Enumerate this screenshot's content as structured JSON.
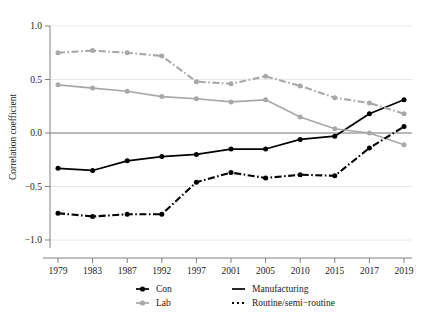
{
  "chart_data": {
    "type": "line",
    "title": "",
    "xlabel": "",
    "ylabel": "Correlation coefficient",
    "categories": [
      "1979",
      "1983",
      "1987",
      "1992",
      "1997",
      "2001",
      "2005",
      "2010",
      "2015",
      "2017",
      "2019"
    ],
    "ylim": [
      -1.15,
      1.12
    ],
    "yticks": [
      "1.0",
      "0.5",
      "0.0",
      "-0.5",
      "-1.0"
    ],
    "ytick_values": [
      1.0,
      0.5,
      0.0,
      -0.5,
      -1.0
    ],
    "grid": true,
    "grid_axis": "y",
    "zero_line": true,
    "legend_position": "bottom",
    "series": [
      {
        "name": "Con",
        "color": "#000000",
        "style": "solid",
        "marker": "circle",
        "values": [
          -0.33,
          -0.35,
          -0.26,
          -0.22,
          -0.2,
          -0.15,
          -0.15,
          -0.06,
          -0.03,
          0.18,
          0.31
        ]
      },
      {
        "name": "Lab",
        "color": "#a8a8a8",
        "style": "solid",
        "marker": "circle",
        "values": [
          0.45,
          0.42,
          0.39,
          0.34,
          0.32,
          0.29,
          0.31,
          0.15,
          0.04,
          0.0,
          -0.11
        ]
      },
      {
        "name": "Manufacturing",
        "color": "#a8a8a8",
        "style": "dash-dot",
        "marker": "circle",
        "values": [
          0.75,
          0.77,
          0.75,
          0.72,
          0.48,
          0.46,
          0.53,
          0.44,
          0.33,
          0.28,
          0.18
        ]
      },
      {
        "name": "Routine/semi-routine",
        "color": "#000000",
        "style": "dash-dot",
        "marker": "circle",
        "values": [
          -0.75,
          -0.78,
          -0.76,
          -0.76,
          -0.46,
          -0.37,
          -0.42,
          -0.39,
          -0.4,
          -0.14,
          0.06
        ]
      }
    ]
  },
  "legend": {
    "entries": [
      {
        "label": "Con",
        "color": "#000000",
        "style": "solid",
        "marker": true
      },
      {
        "label": "Lab",
        "color": "#a8a8a8",
        "style": "solid",
        "marker": true
      },
      {
        "label": "Manufacturing",
        "color": "#000000",
        "style": "solid",
        "marker": false
      },
      {
        "label": "Routine/semi-routine",
        "color": "#000000",
        "style": "dotted",
        "marker": false
      }
    ]
  },
  "colors": {
    "black": "#000000",
    "gray": "#a8a8a8",
    "axis": "#808080",
    "grid": "#e8e8e8",
    "background": "#ffffff"
  }
}
